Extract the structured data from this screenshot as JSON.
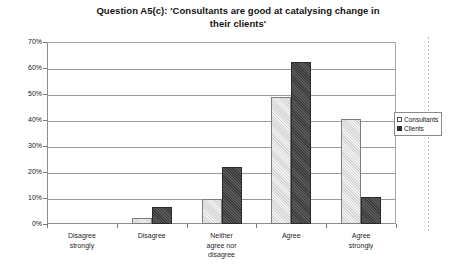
{
  "chart_data": {
    "type": "bar",
    "title": "Question A5(c): 'Consultants are good at catalysing change in their clients'",
    "title_line1": "Question A5(c): 'Consultants are good at catalysing change in",
    "title_line2": "their clients'",
    "xlabel": "",
    "ylabel": "",
    "ylim": [
      0,
      70
    ],
    "ytick_labels": [
      "70%",
      "60%",
      "50%",
      "40%",
      "30%",
      "20%",
      "10%",
      "0%"
    ],
    "ytick_values": [
      70,
      60,
      50,
      40,
      30,
      20,
      10,
      0
    ],
    "grid": true,
    "legend_position": "right",
    "categories": [
      "Disagree strongly",
      "Disagree",
      "Neither agree nor disagree",
      "Agree",
      "Agree strongly"
    ],
    "category_lines": [
      [
        "Disagree",
        "strongly"
      ],
      [
        "Disagree"
      ],
      [
        "Neither",
        "agree nor",
        "disagree"
      ],
      [
        "Agree"
      ],
      [
        "Agree",
        "strongly"
      ]
    ],
    "series": [
      {
        "name": "Consultants",
        "color": "#f1f1f1",
        "values": [
          0,
          2.5,
          9.5,
          49,
          40.5
        ]
      },
      {
        "name": "Clients",
        "color": "#3c3c3c",
        "values": [
          0,
          6.5,
          22,
          62.5,
          10.5
        ]
      }
    ]
  }
}
